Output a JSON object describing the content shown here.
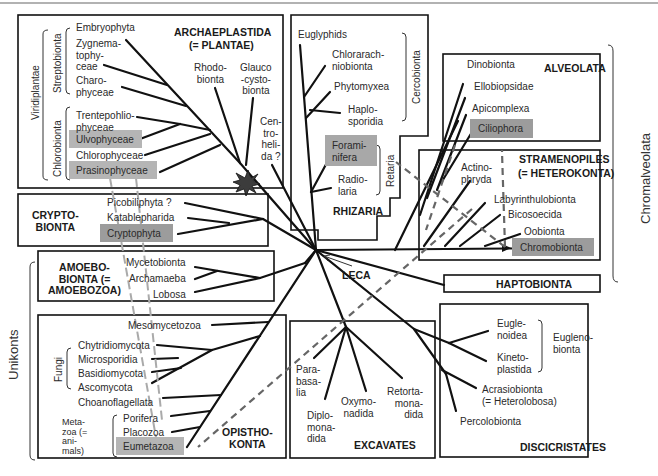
{
  "diagram": {
    "type": "phylogenetic-tree",
    "root_label": "LECA",
    "supergroups": {
      "archaeplastida": {
        "title1": "ARCHAEPLASTIDA",
        "title2": "(= PLANTAE)",
        "viridiplantae_label": "Viridiplantae",
        "streptobionta_label": "Streptobionta",
        "chlorobionta_label": "Chlorobionta",
        "taxa": [
          "Embryophyta",
          "Zygnema-\ntophy-\nceae",
          "Charo-\nphyceae",
          "Trentepohlio-\nphyceae",
          "Ulvophyceae",
          "Chlorophyceae",
          "Prasinophyceae",
          "Rhodo-\nbionta",
          "Glauco\n-cysto-\nbionta"
        ],
        "centrohelida": "Cen-\ntro-\nheli-\nda ?"
      },
      "rhizaria": {
        "title": "RHIZARIA",
        "cercobionta_label": "Cercobionta",
        "retaria_label": "Retaria",
        "taxa": [
          "Euglyphids",
          "Chlorarach-\nniobionta",
          "Phytomyxea",
          "Haplo-\nsporidia",
          "Forami-\nnifera",
          "Radio-\nlaria"
        ]
      },
      "alveolata": {
        "title": "ALVEOLATA",
        "taxa": [
          "Dinobionta",
          "Ellobiopsidae",
          "Apicomplexa",
          "Ciliophora"
        ]
      },
      "stramenopiles": {
        "title1": "STRAMENOPILES",
        "title2": "(= HETEROKONTA)",
        "taxa": [
          "Actino-\nphryda",
          "Labyrinthulobionta",
          "Bicosoecida",
          "Oobionta",
          "Chromobionta"
        ]
      },
      "chromalveolata_label": "Chromalveolata",
      "haptobionta": {
        "title": "HAPTOBIONTA"
      },
      "cryptobionta": {
        "title": "CRYPTO-\nBIONTA",
        "taxa": [
          "Picobiliphyta ?",
          "Katablepharida",
          "Cryptophyta"
        ]
      },
      "amoebobionta": {
        "title": "AMOEBO-\nBIONTA (=\nAMOEBOZOA)",
        "taxa": [
          "Mycetobionta",
          "Archamaeba",
          "Lobosa"
        ]
      },
      "unikonts_label": "Unikonts",
      "opisthokonta": {
        "title": "OPISTHO-\nKONTA",
        "fungi_label": "Fungi",
        "metazoa_label": "Meta-\nzoa (=\nani-\nmals)",
        "taxa": [
          "Mesomycetozoa",
          "Chytridiomycota",
          "Microsporidia",
          "Basidiomycota",
          "Ascomycota",
          "Choanoflagellata",
          "Porifera",
          "Placozoa",
          "Eumetazoa"
        ]
      },
      "excavates": {
        "title": "EXCAVATES",
        "taxa": [
          "Para-\nbasa-\nlia",
          "Diplo-\nmona-\ndida",
          "Oxymo-\nnadida",
          "Retorta-\nmona-\ndida"
        ]
      },
      "discicristates": {
        "title": "DISCICRISTATES",
        "euglenobionta_label": "Eugleno-\nbionta",
        "acrasio": "Acrasiobionta\n(= Heterolobosa)",
        "taxa": [
          "Eugle-\nnoidea",
          "Kineto-\nplastida",
          "Percolobionta"
        ]
      }
    },
    "highlight_color": "#9c9c9c",
    "line_color": "#111111",
    "dashed_color": "#666666"
  }
}
